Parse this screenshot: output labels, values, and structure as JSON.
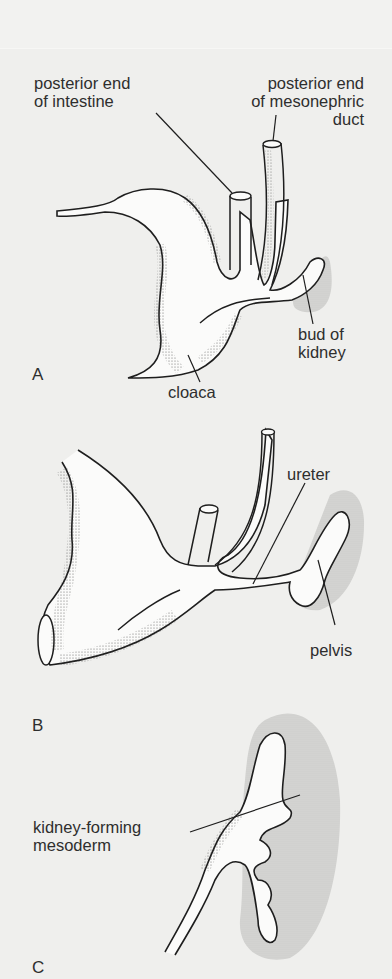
{
  "figure": {
    "panels": [
      {
        "id": "A",
        "letter": "A",
        "labels": {
          "intestine_line1": "posterior end",
          "intestine_line2": "of intestine",
          "duct_line1": "posterior end",
          "duct_line2": "of mesonephric",
          "duct_line3": "duct",
          "bud_line1": "bud of",
          "bud_line2": "kidney",
          "cloaca": "cloaca"
        }
      },
      {
        "id": "B",
        "letter": "B",
        "labels": {
          "ureter": "ureter",
          "pelvis": "pelvis"
        }
      },
      {
        "id": "C",
        "letter": "C",
        "labels": {
          "mesoderm_line1": "kidney-forming",
          "mesoderm_line2": "mesoderm"
        }
      }
    ],
    "colors": {
      "background": "#efefed",
      "ink": "#1e1e1e",
      "mesoderm_shade": "#c9c9c7",
      "fill": "#fbfbfa"
    }
  }
}
